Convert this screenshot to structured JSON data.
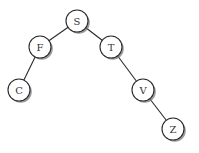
{
  "diagram": {
    "type": "binary-tree",
    "node_radius": 11,
    "nodes": [
      {
        "id": "S",
        "label": "S",
        "x": 77,
        "y": 21
      },
      {
        "id": "F",
        "label": "F",
        "x": 40,
        "y": 47
      },
      {
        "id": "T",
        "label": "T",
        "x": 111,
        "y": 47
      },
      {
        "id": "C",
        "label": "C",
        "x": 19,
        "y": 90
      },
      {
        "id": "V",
        "label": "V",
        "x": 143,
        "y": 90
      },
      {
        "id": "Z",
        "label": "Z",
        "x": 173,
        "y": 129
      }
    ],
    "edges": [
      {
        "from": "S",
        "to": "F"
      },
      {
        "from": "S",
        "to": "T"
      },
      {
        "from": "F",
        "to": "C"
      },
      {
        "from": "T",
        "to": "V"
      },
      {
        "from": "V",
        "to": "Z"
      }
    ]
  }
}
